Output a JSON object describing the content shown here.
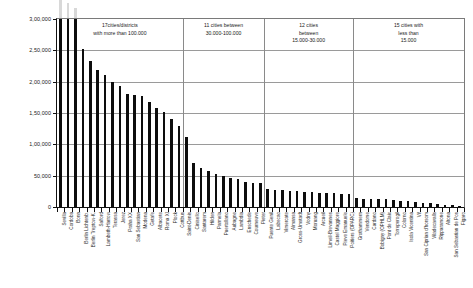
{
  "chart_data": {
    "type": "bar",
    "title": "",
    "xlabel": "",
    "ylabel": "",
    "ylim": [
      0,
      300000
    ],
    "grid": true,
    "legend": "none",
    "y_ticks": [
      {
        "value": 0,
        "label": "0"
      },
      {
        "value": 50000,
        "label": "50,000"
      },
      {
        "value": 100000,
        "label": "1,00,000"
      },
      {
        "value": 150000,
        "label": "1,50,000"
      },
      {
        "value": 200000,
        "label": "2,00,000"
      },
      {
        "value": 250000,
        "label": "2,50,000"
      },
      {
        "value": 300000,
        "label": "3,00,000"
      }
    ],
    "note": "First three bars are clipped at the 3,00,000 axis maximum; faint grey stubs extend above the plot frame.",
    "categories": [
      "Sevilla",
      "Cordoba",
      "Bonn",
      "Berlin Lichtenb.",
      "Berlin Treptow-K.",
      "Salford",
      "Lambeth-Harrow",
      "Terassa",
      "Jerez",
      "Praha XX",
      "San Sebastian",
      "Modena",
      "Getafe",
      "Albacete",
      "Roma XI",
      "Plock",
      "Cottbus",
      "Saint-Denis",
      "Cinisello",
      "Santarem",
      "Hilden",
      "Parmela",
      "Puertollano",
      "Aubagne",
      "Lambdia",
      "Enschede",
      "Courneuve",
      "Pieter",
      "Puente Genil",
      "Labecao",
      "Vimercate",
      "Almansa",
      "Gross-Umstadt",
      "Vodny",
      "Moruang",
      "Arcueil",
      "Limeil-Brevannes",
      "Castel Maggiore",
      "Pieve Emanuele",
      "Poitiers (OPARC)",
      "Grothammern",
      "Vendome",
      "Cardano",
      "Bobigny (OPHLM)",
      "Pont de Claix",
      "Torreperogil",
      "Colorno",
      "Isola Vicentina",
      "Vif",
      "San Ciprian d'horsom",
      "Viladecavalls",
      "Ripparamone",
      "Altona",
      "San Sebastian de Pos",
      "Figaro"
    ],
    "values": [
      300000,
      300000,
      300000,
      252000,
      233000,
      219000,
      210000,
      200000,
      193000,
      181000,
      178000,
      177000,
      168000,
      158000,
      152000,
      141000,
      130000,
      112000,
      71000,
      63000,
      57000,
      52000,
      49000,
      46000,
      44000,
      40000,
      39000,
      39000,
      28000,
      27000,
      27000,
      26000,
      25000,
      24000,
      24000,
      23000,
      22000,
      22000,
      21000,
      20000,
      14000,
      13000,
      13000,
      12000,
      12000,
      11000,
      10000,
      9000,
      8000,
      7000,
      6000,
      5000,
      4000,
      2500,
      1500
    ],
    "overflow_values": [
      332000,
      325000,
      318000
    ],
    "annotations": [
      {
        "lines": [
          "17cities/districts",
          "with more than 100.000"
        ],
        "start_index": 0,
        "end_index": 16,
        "count": 17,
        "range": "more than 100.000"
      },
      {
        "lines": [
          "11 cities between",
          "30.000-100.000"
        ],
        "start_index": 17,
        "end_index": 27,
        "count": 11,
        "range": "30.000-100.000"
      },
      {
        "lines": [
          "12 cities",
          "between",
          "15.000-30.000"
        ],
        "start_index": 28,
        "end_index": 39,
        "count": 12,
        "range": "15.000-30.000"
      },
      {
        "lines": [
          "15 cities with",
          "less than",
          "15.000"
        ],
        "start_index": 40,
        "end_index": 54,
        "count": 15,
        "range": "less than 15.000"
      }
    ],
    "colors": {
      "bar": "#0d0d0d",
      "bar_overflow": "#d8d8d8",
      "grid": "#9a9a9a",
      "axis": "#111111",
      "background": "#ffffff",
      "text": "#1a1a1a"
    }
  }
}
